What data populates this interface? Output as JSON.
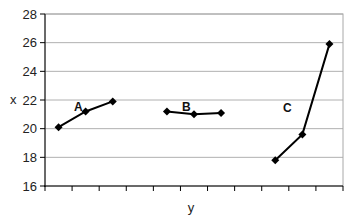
{
  "chart_data": {
    "type": "line",
    "title": "",
    "xlabel": "y",
    "ylabel": "x",
    "ylim": [
      16,
      28
    ],
    "yticks": [
      16,
      18,
      20,
      22,
      24,
      26,
      28
    ],
    "grid": true,
    "legend": "none (inline series labels)",
    "categories": [
      "1",
      "2",
      "3",
      "4",
      "5",
      "6",
      "7",
      "8",
      "9",
      "10",
      "11"
    ],
    "x_tick_labels_shown": false,
    "series": [
      {
        "name": "A",
        "x": [
          1,
          2,
          3
        ],
        "values": [
          20.1,
          21.2,
          21.9
        ]
      },
      {
        "name": "B",
        "x": [
          5,
          6,
          7
        ],
        "values": [
          21.2,
          21.0,
          21.1
        ]
      },
      {
        "name": "C",
        "x": [
          9,
          10,
          11
        ],
        "values": [
          17.8,
          19.6,
          25.9
        ]
      }
    ],
    "marker": "diamond",
    "line_color": "#000000",
    "grid_color": "#b0b0b0"
  },
  "labels": {
    "xlabel": "y",
    "ylabel": "x",
    "yticks": [
      "16",
      "18",
      "20",
      "22",
      "24",
      "26",
      "28"
    ],
    "series_A": "A",
    "series_B": "B",
    "series_C": "C"
  }
}
